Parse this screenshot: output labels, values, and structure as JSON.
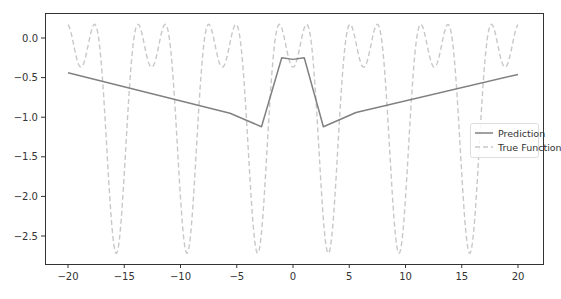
{
  "chart_data": {
    "type": "line",
    "title": "",
    "xlabel": "",
    "ylabel": "",
    "xlim": [
      -22.1,
      22.1
    ],
    "ylim": [
      -2.87,
      0.32
    ],
    "grid": false,
    "legend_position": "center right",
    "x_ticks": [
      -20,
      -15,
      -10,
      -5,
      0,
      5,
      10,
      15,
      20
    ],
    "x_tick_labels": [
      "−20",
      "−15",
      "−10",
      "−5",
      "0",
      "5",
      "10",
      "15",
      "20"
    ],
    "y_ticks": [
      0.0,
      -0.5,
      -1.0,
      -1.5,
      -2.0,
      -2.5
    ],
    "y_tick_labels": [
      "0.0",
      "−0.5",
      "−1.0",
      "−1.5",
      "−2.0",
      "−2.5"
    ],
    "series": [
      {
        "name": "Prediction",
        "style": "solid",
        "color": "#808080",
        "x": [
          -20,
          -5.6,
          -2.8,
          -1.0,
          0.0,
          1.0,
          2.7,
          5.6,
          20
        ],
        "y": [
          -0.44,
          -0.95,
          -1.12,
          -0.25,
          -0.27,
          -0.25,
          -1.12,
          -0.94,
          -0.46
        ]
      },
      {
        "name": "True Function",
        "style": "dashed",
        "color": "#c8c8c8",
        "formula": "sin(x)^2 - exp(-cos(x))",
        "x_range": [
          -20,
          20
        ],
        "peak_value": 0.17,
        "shallow_min_value": -0.37,
        "deep_min_value": -2.72
      }
    ]
  },
  "legend": {
    "items": [
      {
        "label": "Prediction",
        "style": "solid"
      },
      {
        "label": "True Function",
        "style": "dashed"
      }
    ]
  },
  "caption": {
    "text": ""
  }
}
